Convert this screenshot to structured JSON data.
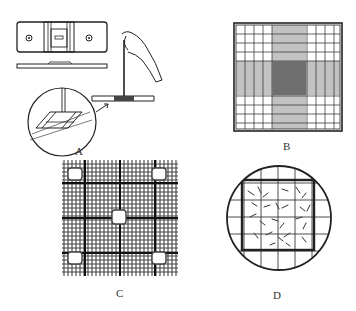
{
  "figure": {
    "panels": [
      {
        "id": "A",
        "label": "A",
        "description": "Hemocytometer slide top view, side view, and pipette loading with magnified inset"
      },
      {
        "id": "B",
        "label": "B",
        "description": "Counting grid with dense central cross ruling"
      },
      {
        "id": "C",
        "label": "C",
        "description": "Grid ruling with five highlighted counting squares"
      },
      {
        "id": "D",
        "label": "D",
        "description": "Circular field of view over grid with scattered rod-shaped objects"
      }
    ]
  },
  "colors": {
    "ink": "#222222",
    "background": "#ffffff"
  }
}
